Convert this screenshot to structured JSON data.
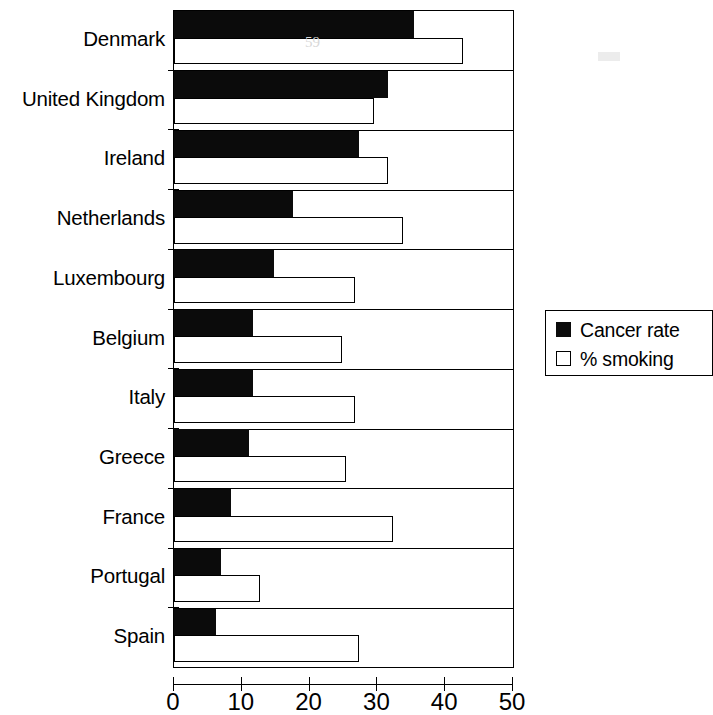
{
  "chart_data": {
    "type": "bar",
    "orientation": "horizontal",
    "title": "",
    "xlabel": "",
    "ylabel": "",
    "xlim": [
      0,
      50
    ],
    "xticks": [
      0,
      10,
      20,
      30,
      40,
      50
    ],
    "xtick_labels": [
      "0",
      "10",
      "20",
      "30",
      "40",
      "50"
    ],
    "grid": false,
    "legend_position": "right",
    "categories": [
      "Denmark",
      "United Kingdom",
      "Ireland",
      "Netherlands",
      "Luxembourg",
      "Belgium",
      "Italy",
      "Greece",
      "France",
      "Portugal",
      "Spain"
    ],
    "series": [
      {
        "name": "Cancer rate",
        "color": "#0b0b0b",
        "values": [
          35.4,
          31.5,
          27.3,
          17.6,
          14.8,
          11.7,
          11.7,
          11.1,
          8.4,
          7.0,
          6.2
        ]
      },
      {
        "name": "% smoking",
        "color": "#ffffff",
        "values": [
          42.6,
          29.5,
          31.5,
          33.8,
          26.7,
          24.8,
          26.7,
          25.4,
          32.3,
          12.7,
          27.3
        ]
      }
    ]
  },
  "legend": {
    "items": [
      {
        "label": "Cancer rate",
        "swatch": "filled-square-icon"
      },
      {
        "label": "% smoking",
        "swatch": "empty-square-icon"
      }
    ]
  },
  "artifacts": {
    "denmark_smudge": "59",
    "upper_right_smudge": ""
  }
}
